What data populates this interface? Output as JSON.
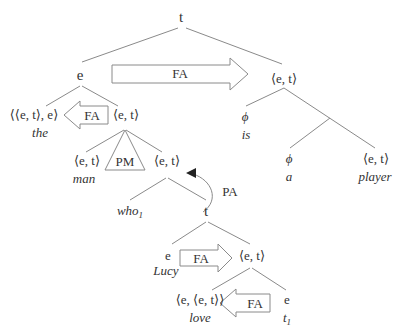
{
  "tree": {
    "root": {
      "type": "t"
    },
    "left_np": {
      "type": "e"
    },
    "vp": {
      "type": "⟨e, t⟩"
    },
    "det": {
      "type": "⟨⟨e, t⟩, e⟩",
      "word": "the"
    },
    "nbar": {
      "type": "⟨e, t⟩"
    },
    "noun": {
      "type": "⟨e, t⟩",
      "word": "man"
    },
    "relcl": {
      "type": "⟨e, t⟩"
    },
    "rel_pron": {
      "word": "who",
      "index": "1"
    },
    "rel_s": {
      "type": "t"
    },
    "subj": {
      "type": "e",
      "word": "Lucy"
    },
    "rel_vp": {
      "type": "⟨e, t⟩"
    },
    "verb": {
      "type": "⟨e, ⟨e, t⟩⟩",
      "word": "love"
    },
    "trace": {
      "type": "e",
      "word": "t",
      "index": "1"
    },
    "copula": {
      "type": "ϕ",
      "word": "is"
    },
    "indef": {
      "type": "ϕ",
      "word": "a"
    },
    "pred_noun": {
      "type": "⟨e, t⟩",
      "word": "player"
    }
  },
  "rules": {
    "main_fa": "FA",
    "det_fa": "FA",
    "pm": "PM",
    "pa": "PA",
    "subj_fa": "FA",
    "verb_fa": "FA"
  }
}
